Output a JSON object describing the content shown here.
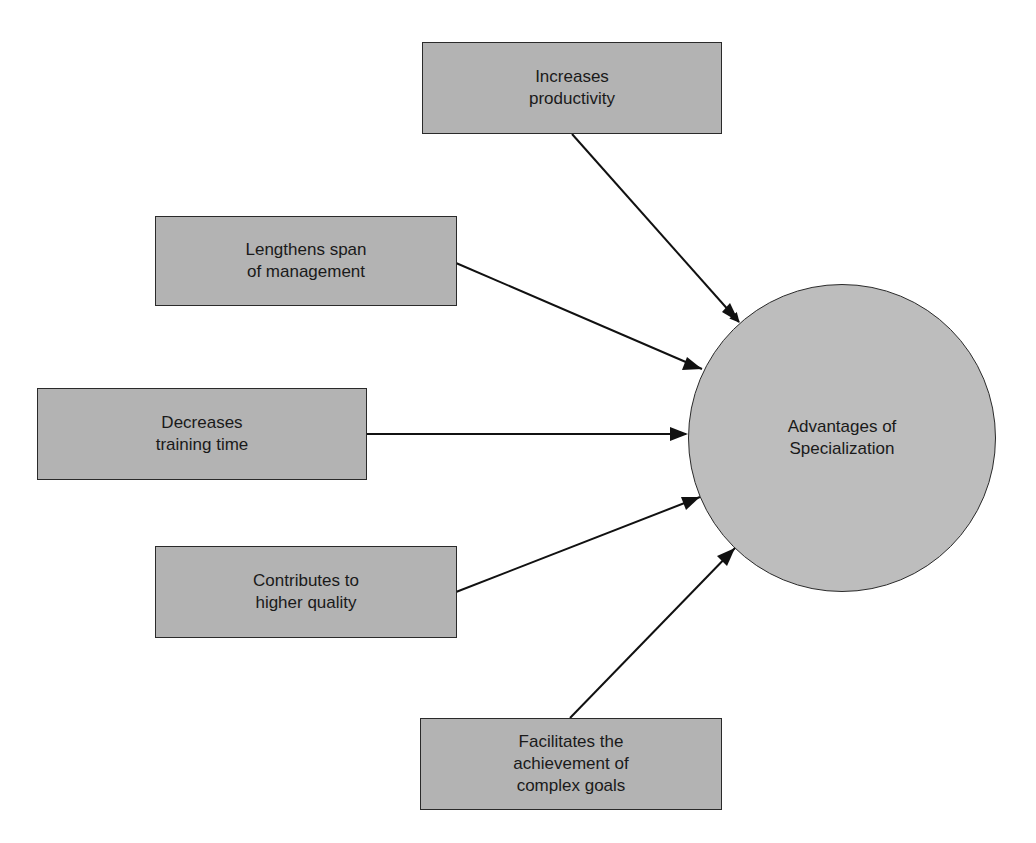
{
  "diagram": {
    "center": {
      "label": "Advantages of\nSpecialization"
    },
    "factors": [
      {
        "label": "Increases\nproductivity"
      },
      {
        "label": "Lengthens span\nof management"
      },
      {
        "label": "Decreases\ntraining time"
      },
      {
        "label": "Contributes to\nhigher quality"
      },
      {
        "label": "Facilitates the\nachievement of\ncomplex goals"
      }
    ]
  },
  "colors": {
    "box_fill": "#b3b3b3",
    "circle_fill": "#bdbdbd",
    "stroke": "#1a1a1a"
  }
}
